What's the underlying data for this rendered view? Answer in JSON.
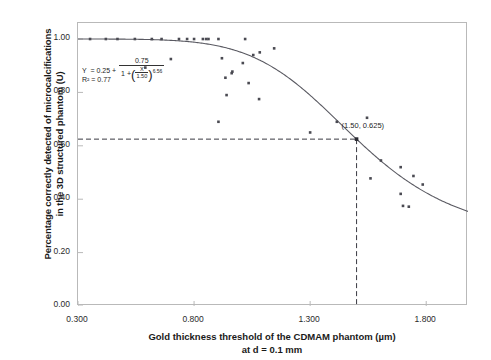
{
  "chart_data": {
    "type": "scatter",
    "title": "",
    "xlabel": "Gold thickness threshold of the CDMAM  phantom (µm)",
    "xlabel_line2": "at d = 0.1 mm",
    "ylabel": "Percentage correctly detected of microcalcifications",
    "ylabel_line2": "in the 3D structured phantom (U)",
    "xlim": [
      0.3,
      1.98
    ],
    "ylim": [
      0.0,
      1.06
    ],
    "xticks": [
      "0.300",
      "0.800",
      "1.300",
      "1.800"
    ],
    "xtick_values": [
      0.3,
      0.8,
      1.3,
      1.8
    ],
    "yticks": [
      "0.00",
      "0.20",
      "0.40",
      "0.60",
      "0.80",
      "1.00"
    ],
    "ytick_values": [
      0.0,
      0.2,
      0.4,
      0.6,
      0.8,
      1.0
    ],
    "grid": false,
    "legend": "none",
    "marker_color": "#4a4a52",
    "curve_color": "#5a5a62",
    "frame_color": "#b9b9b9",
    "fit": {
      "model": "four-parameter logistic",
      "expression": "Y = 0.25 + 0.75 / (1 + (X/1.50)^6.56)",
      "bottom": 0.25,
      "span": 0.75,
      "ec50": 1.5,
      "hill": 6.56,
      "r_squared": 0.77,
      "r_squared_label": "R² = 0.77"
    },
    "equation_parts": {
      "lhs": "Y",
      "eq_sign": "=",
      "intercept": "0.25",
      "plus": "+",
      "frac_num": "0.75",
      "den_lead": "1 +",
      "inner_num": "X",
      "inner_den": "1.50",
      "exponent": "6.56"
    },
    "annotation": {
      "label": "(1.50, 0.625)",
      "x": 1.5,
      "y": 0.625
    },
    "reference_lines": [
      {
        "orientation": "horizontal",
        "value": 0.625,
        "style": "dashed"
      },
      {
        "orientation": "vertical",
        "value": 1.5,
        "style": "dashed"
      }
    ],
    "points": [
      [
        0.352,
        1.0
      ],
      [
        0.42,
        1.0
      ],
      [
        0.47,
        1.0
      ],
      [
        0.545,
        1.0
      ],
      [
        0.618,
        1.0
      ],
      [
        0.66,
        1.0
      ],
      [
        0.735,
        1.0
      ],
      [
        0.77,
        1.0
      ],
      [
        0.8,
        1.0
      ],
      [
        0.838,
        1.0
      ],
      [
        0.852,
        1.0
      ],
      [
        0.862,
        1.0
      ],
      [
        0.905,
        1.0
      ],
      [
        1.02,
        1.0
      ],
      [
        1.145,
        0.965
      ],
      [
        1.083,
        0.95
      ],
      [
        1.055,
        0.94
      ],
      [
        0.92,
        0.928
      ],
      [
        0.7,
        0.925
      ],
      [
        1.01,
        0.91
      ],
      [
        0.59,
        0.893
      ],
      [
        0.965,
        0.878
      ],
      [
        0.962,
        0.872
      ],
      [
        0.935,
        0.855
      ],
      [
        1.035,
        0.835
      ],
      [
        0.94,
        0.79
      ],
      [
        1.08,
        0.775
      ],
      [
        1.545,
        0.705
      ],
      [
        1.415,
        0.69
      ],
      [
        0.905,
        0.69
      ],
      [
        1.3,
        0.65
      ],
      [
        1.5,
        0.625
      ],
      [
        1.605,
        0.545
      ],
      [
        1.69,
        0.52
      ],
      [
        1.56,
        0.478
      ],
      [
        1.745,
        0.487
      ],
      [
        1.785,
        0.455
      ],
      [
        1.69,
        0.42
      ],
      [
        1.7,
        0.375
      ],
      [
        1.725,
        0.372
      ]
    ],
    "curve_description": "Smooth decreasing sigmoid from 1.00 at x=0.300 to about 0.35 at x=1.980, inflection at x=1.50 where y=0.625"
  }
}
